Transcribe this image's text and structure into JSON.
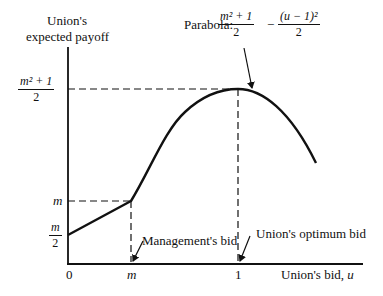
{
  "diagram": {
    "y_axis_label_line1": "Union's",
    "y_axis_label_line2": "expected payoff",
    "x_axis_label": "Union's bid, ",
    "x_axis_var": "u",
    "y_ticks": {
      "top_num": "m² + 1",
      "top_den": "2",
      "mid": "m",
      "low_num": "m",
      "low_den": "2"
    },
    "x_ticks": {
      "zero": "0",
      "m": "m",
      "one": "1"
    },
    "annotations": {
      "parabola_prefix": "Parabola: ",
      "parabola_frac1_num": "m² + 1",
      "parabola_frac1_den": "2",
      "parabola_minus": "−",
      "parabola_frac2_num": "(u − 1)²",
      "parabola_frac2_den": "2",
      "management_bid": "Management's bid",
      "union_optimum_bid": "Union's optimum bid"
    },
    "colors": {
      "ink": "#111111",
      "background": "#ffffff"
    }
  }
}
